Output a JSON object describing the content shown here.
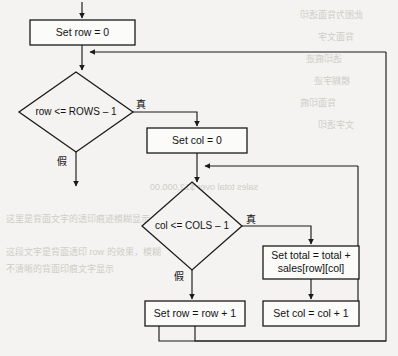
{
  "diagram": {
    "type": "flowchart",
    "colors": {
      "page_background": "#f4f3f1",
      "node_fill": "#fbfbfa",
      "stroke": "#1a1a1a",
      "ghost_text": "#cfcdc9"
    },
    "nodes": [
      {
        "id": "set-row-zero",
        "shape": "process",
        "label": "Set row = 0",
        "x": 30,
        "y": 20,
        "width": 105,
        "height": 25
      },
      {
        "id": "row-condition",
        "shape": "decision",
        "label": "row <= ROWS – 1",
        "cx": 76,
        "cy": 112,
        "rx": 57,
        "ry": 40
      },
      {
        "id": "set-col-zero",
        "shape": "process",
        "label": "Set col = 0",
        "x": 147,
        "y": 128,
        "width": 100,
        "height": 25
      },
      {
        "id": "col-condition",
        "shape": "decision",
        "label": "col <= COLS – 1",
        "cx": 192,
        "cy": 226,
        "rx": 50,
        "ry": 44
      },
      {
        "id": "set-total",
        "shape": "process",
        "label_line_1": "Set total = total +",
        "label_line_2": "sales[row][col]",
        "x": 263,
        "y": 246,
        "width": 96,
        "height": 33
      },
      {
        "id": "set-row-increment",
        "shape": "process",
        "label": "Set row = row + 1",
        "x": 145,
        "y": 301,
        "width": 100,
        "height": 25
      },
      {
        "id": "set-col-increment",
        "shape": "process",
        "label": "Set col = col + 1",
        "x": 263,
        "y": 301,
        "width": 96,
        "height": 25
      }
    ],
    "branch_labels": [
      {
        "id": "row-true",
        "text": "真",
        "x": 141,
        "y": 105
      },
      {
        "id": "row-false",
        "text": "假",
        "x": 62,
        "y": 162
      },
      {
        "id": "col-true",
        "text": "真",
        "x": 251,
        "y": 220
      },
      {
        "id": "col-false",
        "text": "假",
        "x": 179,
        "y": 277
      }
    ],
    "edges": [
      {
        "id": "entry-to-set-row-zero",
        "from": "start",
        "to": "set-row-zero",
        "arrow": true
      },
      {
        "id": "set-row-zero-to-row-condition",
        "from": "set-row-zero",
        "to": "row-condition",
        "arrow": true
      },
      {
        "id": "row-condition-true-to-set-col-zero",
        "from": "row-condition",
        "to": "set-col-zero",
        "label": "真",
        "arrow": true
      },
      {
        "id": "row-condition-false-to-exit",
        "from": "row-condition",
        "to": "exit",
        "label": "假",
        "arrow": true
      },
      {
        "id": "set-col-zero-to-col-condition",
        "from": "set-col-zero",
        "to": "col-condition",
        "arrow": true
      },
      {
        "id": "col-condition-true-to-set-total",
        "from": "col-condition",
        "to": "set-total",
        "label": "真",
        "arrow": true
      },
      {
        "id": "col-condition-false-to-set-row-increment",
        "from": "col-condition",
        "to": "set-row-increment",
        "label": "假",
        "arrow": true
      },
      {
        "id": "set-total-to-set-col-increment",
        "from": "set-total",
        "to": "set-col-increment",
        "arrow": true
      },
      {
        "id": "set-col-increment-loop-back-to-col-condition",
        "from": "set-col-increment",
        "to": "set-col-zero-junction",
        "arrow": true
      },
      {
        "id": "set-row-increment-loop-back-to-row-condition",
        "from": "set-row-increment",
        "to": "set-row-zero-junction",
        "arrow": true
      }
    ],
    "ghost_text": [
      {
        "id": "ghost-1",
        "text": "此图为背面透印",
        "x": 300,
        "y": 8
      },
      {
        "id": "ghost-2",
        "text": "背面文字",
        "x": 318,
        "y": 30
      },
      {
        "id": "ghost-3",
        "text": "透印痕迹",
        "x": 306,
        "y": 52
      },
      {
        "id": "ghost-4",
        "text": "模糊字迹",
        "x": 314,
        "y": 74
      },
      {
        "id": "ghost-5",
        "text": "背面印痕",
        "x": 300,
        "y": 96
      },
      {
        "id": "ghost-6",
        "text": "文字透印",
        "x": 318,
        "y": 118
      },
      {
        "id": "ghost-7",
        "text": "sales total over $12,000.00",
        "x": 150,
        "y": 182
      },
      {
        "id": "ghost-8",
        "text": "这里是背面文字的透印痕迹模糊显示",
        "x": 6,
        "y": 212
      },
      {
        "id": "ghost-9",
        "text": "这段文字是背面透印 row 的效果，模糊",
        "x": 6,
        "y": 245
      },
      {
        "id": "ghost-10",
        "text": "不清晰的背面印痕文字显示",
        "x": 6,
        "y": 262
      }
    ]
  }
}
